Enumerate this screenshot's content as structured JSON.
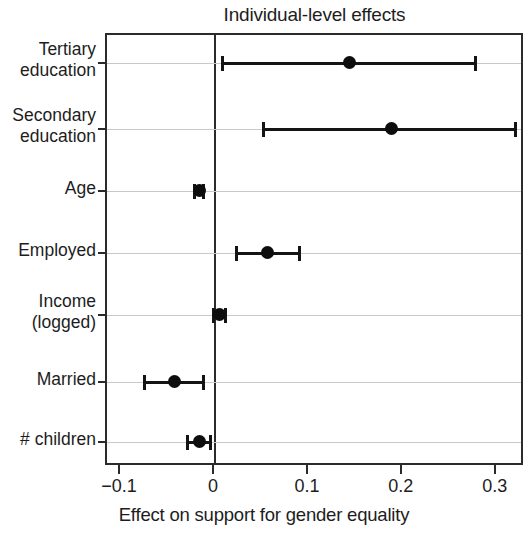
{
  "chart_data": {
    "type": "scatter",
    "subtype": "coefficient-plot",
    "title": "Individual-level effects",
    "xlabel": "Effect on support for gender equality",
    "ylabel": "",
    "xlim": [
      -0.115,
      0.33
    ],
    "xticks": [
      -0.1,
      0,
      0.1,
      0.2,
      0.3
    ],
    "xticklabels": [
      "−0.1",
      "0",
      "0.1",
      "0.2",
      "0.3"
    ],
    "grid": "horizontal",
    "reference_line": 0,
    "legend": "none",
    "categories": [
      "Tertiary education",
      "Secondary education",
      "Age",
      "Employed",
      "Income (logged)",
      "Married",
      "# children"
    ],
    "points": [
      {
        "label": "Tertiary education",
        "label_lines": [
          "Tertiary",
          "education"
        ],
        "estimate": 0.143,
        "ci_low": 0.006,
        "ci_high": 0.279
      },
      {
        "label": "Secondary education",
        "label_lines": [
          "Secondary",
          "education"
        ],
        "estimate": 0.188,
        "ci_low": 0.05,
        "ci_high": 0.322
      },
      {
        "label": "Age",
        "label_lines": [
          "Age"
        ],
        "estimate": -0.017,
        "ci_low": -0.023,
        "ci_high": -0.011
      },
      {
        "label": "Employed",
        "label_lines": [
          "Employed"
        ],
        "estimate": 0.056,
        "ci_low": 0.021,
        "ci_high": 0.091
      },
      {
        "label": "Income (logged)",
        "label_lines": [
          "Income",
          "(logged)"
        ],
        "estimate": 0.005,
        "ci_low": -0.003,
        "ci_high": 0.013
      },
      {
        "label": "Married",
        "label_lines": [
          "Married"
        ],
        "estimate": -0.043,
        "ci_low": -0.077,
        "ci_high": -0.011
      },
      {
        "label": "# children",
        "label_lines": [
          "# children"
        ],
        "estimate": -0.016,
        "ci_low": -0.031,
        "ci_high": -0.003
      }
    ],
    "colors": {
      "point": "#0d0d0d",
      "interval": "#141414",
      "axis": "#2b2b2b",
      "grid": "#c9c9c9",
      "background": "#ffffff",
      "text": "#1d1d1d"
    }
  }
}
